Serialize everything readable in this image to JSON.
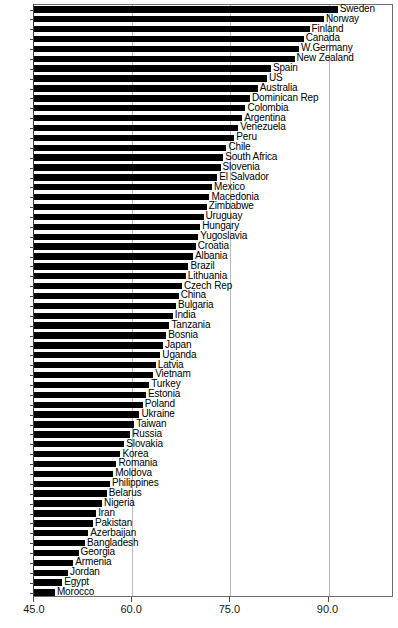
{
  "chart_data": {
    "type": "bar",
    "orientation": "horizontal",
    "title": "",
    "subtitle": "",
    "xlabel": "",
    "ylabel": "",
    "xlim": [
      45.0,
      100.0
    ],
    "grid": true,
    "legend": null,
    "xticks": [
      45.0,
      60.0,
      75.0,
      90.0
    ],
    "xtick_labels": [
      "45.0",
      "60.0",
      "75.0",
      "90.0"
    ],
    "categories": [
      "Sweden",
      "Norway",
      "Finland",
      "Canada",
      "W.Germany",
      "New Zealand",
      "Spain",
      "US",
      "Australia",
      "Dominican Rep",
      "Colombia",
      "Argentina",
      "Venezuela",
      "Peru",
      "Chile",
      "South Africa",
      "Slovenia",
      "El Salvador",
      "Mexico",
      "Macedonia",
      "Zimbabwe",
      "Uruguay",
      "Hungary",
      "Yugoslavia",
      "Croatia",
      "Albania",
      "Brazil",
      "Lithuania",
      "Czech Rep",
      "China",
      "Bulgaria",
      "India",
      "Tanzania",
      "Bosnia",
      "Japan",
      "Uganda",
      "Latvia",
      "Vietnam",
      "Turkey",
      "Estonia",
      "Poland",
      "Ukraine",
      "Taiwan",
      "Russia",
      "Slovakia",
      "Korea",
      "Romania",
      "Moldova",
      "Philippines",
      "Belarus",
      "Nigeria",
      "Iran",
      "Pakistan",
      "Azerbaijan",
      "Bangladesh",
      "Georgia",
      "Armenia",
      "Jordan",
      "Egypt",
      "Morocco"
    ],
    "values": [
      91.4,
      89.3,
      87.1,
      86.2,
      85.5,
      84.8,
      81.2,
      80.6,
      79.2,
      78.0,
      77.3,
      76.8,
      76.2,
      75.6,
      74.4,
      73.9,
      73.5,
      73.0,
      72.2,
      71.8,
      71.4,
      70.9,
      70.4,
      70.1,
      69.7,
      69.3,
      68.6,
      68.2,
      67.6,
      67.1,
      66.7,
      66.2,
      65.7,
      65.2,
      64.7,
      64.3,
      63.6,
      63.2,
      62.6,
      62.1,
      61.6,
      61.1,
      60.3,
      59.7,
      58.8,
      58.2,
      57.6,
      57.1,
      56.6,
      56.1,
      55.4,
      54.5,
      54.0,
      53.3,
      52.8,
      51.8,
      51.0,
      50.2,
      49.3,
      48.2
    ]
  }
}
